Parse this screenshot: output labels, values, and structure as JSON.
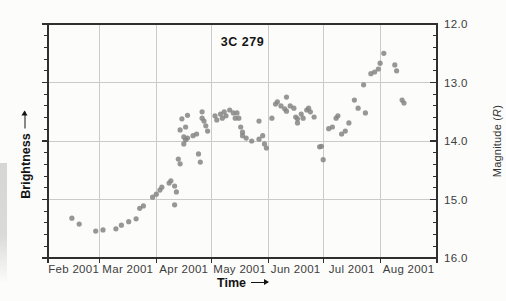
{
  "chart_data": {
    "type": "scatter",
    "title": "3C 279",
    "xlabel": "Time",
    "ylabel_left": "Brightness",
    "ylabel_right": {
      "prefix": "Magnitude (",
      "symbol": "R",
      "suffix": ")"
    },
    "x_axis": {
      "start": "2001-02-01",
      "end": "2001-09-01",
      "tick_dates": [
        "2001-02-01",
        "2001-03-01",
        "2001-04-01",
        "2001-05-01",
        "2001-06-01",
        "2001-07-01",
        "2001-08-01",
        "2001-09-01"
      ],
      "tick_labels": [
        "Feb 2001",
        "Mar 2001",
        "Apr 2001",
        "May 2001",
        "Jun 2001",
        "Jul 2001",
        "Aug 2001"
      ],
      "label_position": "between-ticks"
    },
    "y_axis": {
      "min": 12.0,
      "max": 16.0,
      "inverted": true,
      "major_step": 1.0,
      "minor_step": 0.2,
      "tick_labels": [
        "12.0",
        "13.0",
        "14.0",
        "15.0",
        "16.0"
      ],
      "labels_side": "right"
    },
    "grid": true,
    "legend": "none",
    "colors": {
      "point": "#858585",
      "grid": "#cbcbcb",
      "frame": "#2f2f2f",
      "tick_text": "#3d3d3d",
      "label_text": "#141414",
      "background": "#fcfcfa"
    },
    "points_format": [
      "date",
      "magnitude_R"
    ],
    "points": [
      [
        "2001-02-14",
        15.32
      ],
      [
        "2001-02-18",
        15.42
      ],
      [
        "2001-02-27",
        15.54
      ],
      [
        "2001-03-03",
        15.52
      ],
      [
        "2001-03-10",
        15.5
      ],
      [
        "2001-03-13",
        15.44
      ],
      [
        "2001-03-17",
        15.38
      ],
      [
        "2001-03-21",
        15.33
      ],
      [
        "2001-03-23",
        15.15
      ],
      [
        "2001-03-25",
        15.11
      ],
      [
        "2001-03-30",
        14.96
      ],
      [
        "2001-04-01",
        14.91
      ],
      [
        "2001-04-03",
        14.84
      ],
      [
        "2001-04-04",
        14.79
      ],
      [
        "2001-04-08",
        14.72
      ],
      [
        "2001-04-09",
        14.68
      ],
      [
        "2001-04-11",
        14.77
      ],
      [
        "2001-04-12",
        14.87
      ],
      [
        "2001-04-11",
        15.09
      ],
      [
        "2001-04-13",
        14.31
      ],
      [
        "2001-04-14",
        14.39
      ],
      [
        "2001-04-15",
        13.62
      ],
      [
        "2001-04-18",
        13.56
      ],
      [
        "2001-04-17",
        13.76
      ],
      [
        "2001-04-14",
        13.81
      ],
      [
        "2001-04-16",
        13.93
      ],
      [
        "2001-04-18",
        13.95
      ],
      [
        "2001-04-21",
        13.91
      ],
      [
        "2001-04-16",
        14.05
      ],
      [
        "2001-04-17",
        13.98
      ],
      [
        "2001-04-24",
        14.22
      ],
      [
        "2001-04-25",
        14.36
      ],
      [
        "2001-04-23",
        13.88
      ],
      [
        "2001-04-26",
        13.61
      ],
      [
        "2001-04-26",
        13.5
      ],
      [
        "2001-04-27",
        13.66
      ],
      [
        "2001-04-28",
        13.74
      ],
      [
        "2001-04-29",
        13.83
      ],
      [
        "2001-05-03",
        13.57
      ],
      [
        "2001-05-04",
        13.64
      ],
      [
        "2001-05-06",
        13.54
      ],
      [
        "2001-05-07",
        13.61
      ],
      [
        "2001-05-08",
        13.5
      ],
      [
        "2001-05-09",
        13.57
      ],
      [
        "2001-05-11",
        13.47
      ],
      [
        "2001-05-13",
        13.52
      ],
      [
        "2001-05-14",
        13.61
      ],
      [
        "2001-05-15",
        13.52
      ],
      [
        "2001-05-16",
        13.61
      ],
      [
        "2001-05-17",
        13.76
      ],
      [
        "2001-05-18",
        13.85
      ],
      [
        "2001-05-18",
        13.91
      ],
      [
        "2001-05-20",
        13.95
      ],
      [
        "2001-05-23",
        14.0
      ],
      [
        "2001-05-27",
        13.66
      ],
      [
        "2001-05-27",
        13.97
      ],
      [
        "2001-05-29",
        13.91
      ],
      [
        "2001-05-30",
        14.05
      ],
      [
        "2001-05-31",
        14.12
      ],
      [
        "2001-06-03",
        13.61
      ],
      [
        "2001-06-05",
        13.37
      ],
      [
        "2001-06-06",
        13.33
      ],
      [
        "2001-06-08",
        13.4
      ],
      [
        "2001-06-10",
        13.45
      ],
      [
        "2001-06-11",
        13.25
      ],
      [
        "2001-06-11",
        13.49
      ],
      [
        "2001-06-13",
        13.4
      ],
      [
        "2001-06-15",
        13.44
      ],
      [
        "2001-06-16",
        13.59
      ],
      [
        "2001-06-17",
        13.62
      ],
      [
        "2001-06-17",
        13.69
      ],
      [
        "2001-06-19",
        13.54
      ],
      [
        "2001-06-20",
        13.61
      ],
      [
        "2001-06-22",
        13.47
      ],
      [
        "2001-06-23",
        13.44
      ],
      [
        "2001-06-24",
        13.5
      ],
      [
        "2001-06-26",
        13.59
      ],
      [
        "2001-06-29",
        14.1
      ],
      [
        "2001-06-30",
        14.09
      ],
      [
        "2001-07-01",
        14.32
      ],
      [
        "2001-07-04",
        13.79
      ],
      [
        "2001-07-06",
        13.76
      ],
      [
        "2001-07-08",
        13.61
      ],
      [
        "2001-07-09",
        13.57
      ],
      [
        "2001-07-11",
        13.88
      ],
      [
        "2001-07-13",
        13.83
      ],
      [
        "2001-07-15",
        13.69
      ],
      [
        "2001-07-18",
        13.3
      ],
      [
        "2001-07-20",
        13.44
      ],
      [
        "2001-07-23",
        13.04
      ],
      [
        "2001-07-24",
        13.52
      ],
      [
        "2001-07-27",
        12.85
      ],
      [
        "2001-07-29",
        12.82
      ],
      [
        "2001-07-31",
        12.77
      ],
      [
        "2001-08-01",
        12.67
      ],
      [
        "2001-08-03",
        12.5
      ],
      [
        "2001-08-09",
        12.7
      ],
      [
        "2001-08-10",
        12.8
      ],
      [
        "2001-08-13",
        13.3
      ],
      [
        "2001-08-14",
        13.35
      ]
    ]
  }
}
